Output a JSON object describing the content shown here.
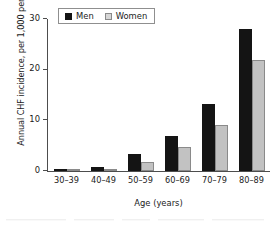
{
  "chart_data": {
    "type": "bar",
    "title": "",
    "xlabel": "Age (years)",
    "ylabel": "Annual CHF incidence, per 1,000 persons",
    "categories": [
      "30–39",
      "40–49",
      "50–59",
      "60–69",
      "70–79",
      "80–89"
    ],
    "series": [
      {
        "name": "Men",
        "color": "#141414",
        "values": [
          0.4,
          0.8,
          3.4,
          7.0,
          13.2,
          28.0
        ]
      },
      {
        "name": "Women",
        "color": "#c2c2c2",
        "values": [
          0.3,
          0.4,
          1.8,
          4.8,
          9.1,
          22.0
        ]
      }
    ],
    "ylim": [
      0,
      30
    ],
    "yticks": [
      0,
      10,
      20,
      30
    ],
    "ytick_labels": [
      "0",
      "10",
      "20",
      "30"
    ],
    "grid": false,
    "legend_position": "top-left-inside"
  },
  "legend": {
    "entries": [
      {
        "label": "Men",
        "swatch": "men-swatch"
      },
      {
        "label": "Women",
        "swatch": "women-swatch"
      }
    ]
  }
}
